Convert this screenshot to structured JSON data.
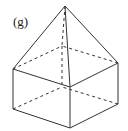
{
  "figure": {
    "label": "(g)",
    "stroke_color": "#333333",
    "background": "#ffffff",
    "vertices": {
      "apex": [
        65,
        6
      ],
      "top_left": [
        13,
        69
      ],
      "top_front": [
        70,
        87
      ],
      "top_right": [
        118,
        63
      ],
      "top_back": [
        62,
        46
      ],
      "bottom_left": [
        13,
        109
      ],
      "bottom_front": [
        70,
        128
      ],
      "bottom_right": [
        118,
        104
      ],
      "bottom_back": [
        62,
        87
      ]
    },
    "visible_edges": [
      [
        "apex",
        "top_left"
      ],
      [
        "apex",
        "top_front"
      ],
      [
        "apex",
        "top_right"
      ],
      [
        "top_left",
        "top_front"
      ],
      [
        "top_front",
        "top_right"
      ],
      [
        "top_left",
        "bottom_left"
      ],
      [
        "top_front",
        "bottom_front"
      ],
      [
        "top_right",
        "bottom_right"
      ],
      [
        "bottom_left",
        "bottom_front"
      ],
      [
        "bottom_front",
        "bottom_right"
      ]
    ],
    "hidden_edges": [
      [
        "apex",
        "top_back"
      ],
      [
        "top_left",
        "top_back"
      ],
      [
        "top_right",
        "top_back"
      ],
      [
        "top_back",
        "bottom_back"
      ],
      [
        "bottom_left",
        "bottom_back"
      ],
      [
        "bottom_right",
        "bottom_back"
      ]
    ]
  }
}
